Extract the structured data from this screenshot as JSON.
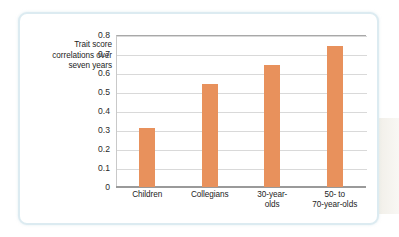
{
  "chart_data": {
    "type": "bar",
    "title": "",
    "subtitle": "",
    "ylabel": "Trait score correlations over seven years",
    "ylabel_lines": [
      "Trait score",
      "correlations over",
      "seven years"
    ],
    "xlabel": "",
    "categories": [
      "Children",
      "Collegians",
      "30-year-olds",
      "50- to 70-year-olds"
    ],
    "category_lines": [
      [
        "Children"
      ],
      [
        "Collegians"
      ],
      [
        "30-year-",
        "olds"
      ],
      [
        "50-  to",
        "70-year-olds"
      ]
    ],
    "values": [
      0.31,
      0.54,
      0.64,
      0.74
    ],
    "ylim": [
      0,
      0.8
    ],
    "yticks": [
      "0",
      "0.1",
      "0.2",
      "0.3",
      "0.4",
      "0.5",
      "0.6",
      "0.7",
      "0.8"
    ],
    "ytick_values": [
      0,
      0.1,
      0.2,
      0.3,
      0.4,
      0.5,
      0.6,
      0.7,
      0.8
    ],
    "grid": true,
    "legend": false,
    "bar_color": "#e8915c",
    "gridline_color": "#d9d9d9",
    "axis_color": "#9a9a9a",
    "frame_color": "#dcebf1",
    "background": "#ffffff"
  }
}
